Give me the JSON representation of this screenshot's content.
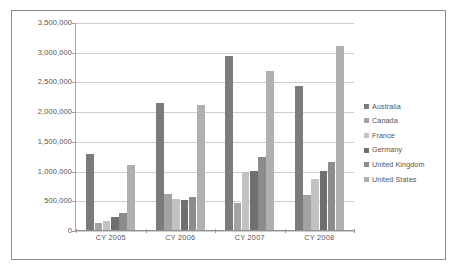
{
  "chart_data": {
    "type": "bar",
    "title": "",
    "subtitle": "",
    "xlabel": "",
    "ylabel": "",
    "grid": true,
    "legend_position": "right",
    "ylim": [
      0,
      3500000
    ],
    "ytick_values": [
      0,
      500000,
      1000000,
      1500000,
      2000000,
      2500000,
      3000000,
      3500000
    ],
    "ytick_labels": [
      "0",
      "500,000",
      "1,000,000",
      "1,500,000",
      "2,000,000",
      "2,500,000",
      "3,000,000",
      "3,500,000"
    ],
    "categories": [
      "CY 2005",
      "CY 2006",
      "CY 2007",
      "CY 2008"
    ],
    "series": [
      {
        "name": "Australia",
        "color": "#7b7b7b",
        "values": [
          1300000,
          2150000,
          2950000,
          2440000
        ]
      },
      {
        "name": "Canada",
        "color": "#a3a3a3",
        "values": [
          140000,
          620000,
          470000,
          600000
        ]
      },
      {
        "name": "France",
        "color": "#c2c2c2",
        "values": [
          175000,
          545000,
          990000,
          870000
        ]
      },
      {
        "name": "Germany",
        "color": "#6f6f6f",
        "values": [
          240000,
          520000,
          1010000,
          1010000
        ]
      },
      {
        "name": "United Kingdom",
        "color": "#8c8c8c",
        "values": [
          310000,
          575000,
          1250000,
          1160000
        ]
      },
      {
        "name": "United States",
        "color": "#b0b0b0",
        "values": [
          1105000,
          2120000,
          2700000,
          3110000
        ]
      }
    ]
  },
  "legend": {
    "items": [
      {
        "label": "Australia",
        "color": "#7b7b7b"
      },
      {
        "label": "Canada",
        "color": "#a3a3a3"
      },
      {
        "label": "France",
        "color": "#c2c2c2"
      },
      {
        "label": "Germany",
        "color": "#6f6f6f"
      },
      {
        "label": "United Kingdom",
        "color": "#8c8c8c"
      },
      {
        "label": "United States",
        "color": "#b0b0b0"
      }
    ]
  },
  "style": {
    "border_color": "#8d8d8d",
    "grid_color": "#cfcfcf",
    "axis_color": "#9a9a9a",
    "text_color": "#55534f",
    "plot_background": "#ffffff"
  }
}
